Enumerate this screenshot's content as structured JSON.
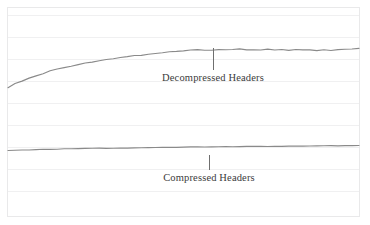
{
  "figure": {
    "background_color": "#ffffff",
    "frame_color": "#e9e9ea",
    "gridline_color": "#f0f0f1",
    "trace_color": "#8a8a8a",
    "leader_color": "#6f6f6f",
    "label_color": "#3b3b3b"
  },
  "annotations": {
    "decompressed": {
      "label": "Decompressed Headers",
      "leader_x": 213,
      "leader_y_top": 48,
      "leader_y_bottom": 70
    },
    "compressed": {
      "label": "Compressed Headers",
      "leader_x": 209,
      "leader_y_top": 155,
      "leader_y_bottom": 170
    }
  },
  "chart_data": {
    "type": "line",
    "title": "",
    "xlabel": "",
    "ylabel": "",
    "xlim": [
      0,
      100
    ],
    "ylim": [
      0,
      100
    ],
    "grid": true,
    "grid_axis": "y",
    "legend": "inline-annotations",
    "xticklabels": [],
    "yticklabels": [],
    "gridlines_y_px": [
      15,
      37,
      59,
      81,
      103,
      125,
      147,
      169,
      191
    ],
    "x": [
      0,
      2,
      4,
      6,
      8,
      10,
      12,
      14,
      16,
      18,
      20,
      22,
      24,
      26,
      28,
      30,
      32,
      34,
      36,
      38,
      40,
      42,
      44,
      46,
      48,
      50,
      52,
      54,
      56,
      58,
      60,
      62,
      64,
      66,
      68,
      70,
      72,
      74,
      76,
      78,
      80,
      82,
      84,
      86,
      88,
      90,
      92,
      94,
      96,
      98,
      100
    ],
    "series": [
      {
        "name": "Decompressed Headers",
        "color": "#8a8a8a",
        "values": [
          60.5,
          62.4,
          64.0,
          65.6,
          66.9,
          68.2,
          69.6,
          70.7,
          71.6,
          72.6,
          73.4,
          74.0,
          74.9,
          75.6,
          76.1,
          76.8,
          77.2,
          77.8,
          78.3,
          78.6,
          79.1,
          79.6,
          79.9,
          80.3,
          80.6,
          81.0,
          81.2,
          81.5,
          81.3,
          81.6,
          81.8,
          81.5,
          81.7,
          81.9,
          81.6,
          81.8,
          81.7,
          81.9,
          81.6,
          81.8,
          81.5,
          81.7,
          81.4,
          81.6,
          81.3,
          81.5,
          81.2,
          81.5,
          81.7,
          81.9,
          82.2
        ]
      },
      {
        "name": "Compressed Headers",
        "color": "#8a8a8a",
        "values": [
          25.0,
          25.2,
          25.3,
          25.4,
          25.5,
          25.6,
          25.7,
          25.8,
          25.9,
          26.0,
          26.0,
          26.1,
          26.2,
          26.2,
          26.3,
          26.3,
          26.4,
          26.4,
          26.5,
          26.5,
          26.6,
          26.6,
          26.7,
          26.7,
          26.8,
          26.8,
          26.9,
          26.9,
          27.0,
          27.0,
          27.1,
          27.1,
          27.1,
          27.2,
          27.2,
          27.2,
          27.3,
          27.3,
          27.3,
          27.4,
          27.4,
          27.4,
          27.5,
          27.5,
          27.5,
          27.6,
          27.6,
          27.6,
          27.7,
          27.7,
          27.8
        ]
      }
    ]
  }
}
